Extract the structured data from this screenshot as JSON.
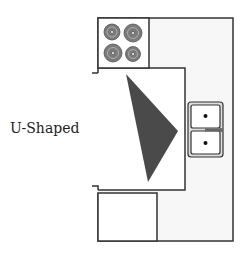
{
  "diagram": {
    "title": "U-Shaped",
    "type": "kitchen-layout",
    "elements": [
      {
        "name": "stove",
        "burners": 4
      },
      {
        "name": "sink",
        "basins": 2
      },
      {
        "name": "work-triangle"
      },
      {
        "name": "counter-top"
      },
      {
        "name": "counter-right"
      },
      {
        "name": "counter-bottom"
      }
    ],
    "colors": {
      "outline": "#333333",
      "counter_fill": "#f7f7f7",
      "triangle": "#4a4a4a",
      "sink_fill": "#dddddd",
      "burner": "#7a7a7a"
    }
  }
}
